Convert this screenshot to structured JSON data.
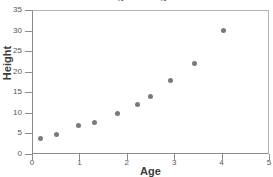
{
  "chart_data": {
    "type": "scatter",
    "title": "Height vs Age",
    "xlabel": "Age",
    "ylabel": "Height",
    "xlim": [
      0,
      5
    ],
    "ylim": [
      0,
      35
    ],
    "xticks": [
      "0",
      "1",
      "2",
      "3",
      "4",
      "5"
    ],
    "xtick_values": [
      0,
      1,
      2,
      3,
      4,
      5
    ],
    "yticks": [
      "0",
      "5",
      "10",
      "15",
      "20",
      "25",
      "30",
      "35"
    ],
    "ytick_values": [
      0,
      5,
      10,
      15,
      20,
      25,
      30,
      35
    ],
    "grid": false,
    "legend": null,
    "marker_color": "#7a7a7a",
    "axis_color": "#8c8c8c",
    "points": [
      {
        "x": 0.15,
        "y": 4.1
      },
      {
        "x": 0.49,
        "y": 5.1
      },
      {
        "x": 0.97,
        "y": 7.1
      },
      {
        "x": 1.29,
        "y": 8.0
      },
      {
        "x": 1.78,
        "y": 10.2
      },
      {
        "x": 2.2,
        "y": 12.3
      },
      {
        "x": 2.48,
        "y": 14.3
      },
      {
        "x": 2.9,
        "y": 18.2
      },
      {
        "x": 3.41,
        "y": 22.2
      },
      {
        "x": 4.02,
        "y": 30.2
      }
    ]
  }
}
